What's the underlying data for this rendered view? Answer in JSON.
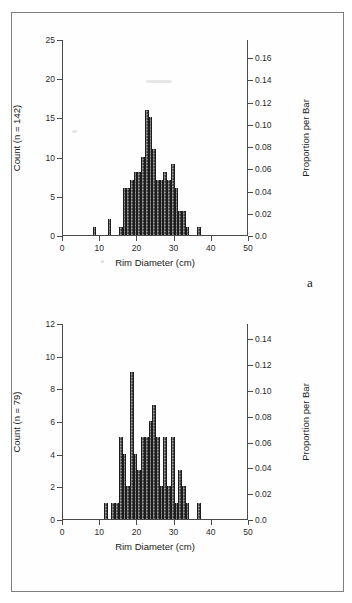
{
  "page": {
    "type": "scanned-figure-page",
    "frame_color": "#7e7e7e",
    "background": "#ffffff"
  },
  "panels": [
    {
      "letter": "a",
      "xlabel": "Rim Diameter (cm)",
      "ylabel_left": "Count (n = 142)",
      "ylabel_right": "Proportion per Bar",
      "x_ticks": [
        "0",
        "10",
        "20",
        "30",
        "40",
        "50"
      ],
      "y_ticks_left": [
        "0",
        "5",
        "10",
        "15",
        "20",
        "25"
      ],
      "y_ticks_right": [
        "0.0",
        "0.02",
        "0.04",
        "0.06",
        "0.08",
        "0.10",
        "0.12",
        "0.14",
        "0.16"
      ]
    },
    {
      "letter": "b",
      "xlabel": "Rim Diameter (cm)",
      "ylabel_left": "Count (n = 79)",
      "ylabel_right": "Proportion per Bar",
      "x_ticks": [
        "0",
        "10",
        "20",
        "30",
        "40",
        "50"
      ],
      "y_ticks_left": [
        "0",
        "2",
        "4",
        "6",
        "8",
        "10",
        "12"
      ],
      "y_ticks_right": [
        "0.0",
        "0.02",
        "0.04",
        "0.06",
        "0.08",
        "0.10",
        "0.12",
        "0.14"
      ]
    }
  ],
  "chart_data": [
    {
      "type": "bar",
      "subtype": "histogram",
      "panel": "a",
      "title": "",
      "xlabel": "Rim Diameter (cm)",
      "ylabel": "Count (n = 142)",
      "ylabel_secondary": "Proportion per Bar",
      "n": 142,
      "bin_width": 1,
      "xlim": [
        0,
        50
      ],
      "ylim": [
        0,
        25
      ],
      "ylim_secondary": [
        0.0,
        0.1761
      ],
      "grid": false,
      "legend": null,
      "bar_color": "#3b3b3b",
      "bin_left_edges": [
        8,
        9,
        12,
        13,
        15,
        16,
        17,
        18,
        19,
        20,
        21,
        22,
        23,
        24,
        25,
        26,
        27,
        28,
        29,
        30,
        31,
        32,
        33,
        36
      ],
      "values": [
        1,
        0,
        2,
        0,
        1,
        6,
        6,
        7,
        8,
        8,
        10,
        16,
        15,
        11,
        7,
        7,
        8,
        7,
        9,
        6,
        3,
        3,
        1,
        1
      ]
    },
    {
      "type": "bar",
      "subtype": "histogram",
      "panel": "b",
      "title": "",
      "xlabel": "Rim Diameter (cm)",
      "ylabel": "Count (n = 79)",
      "ylabel_secondary": "Proportion per Bar",
      "n": 79,
      "bin_width": 1,
      "xlim": [
        0,
        50
      ],
      "ylim": [
        0,
        12
      ],
      "ylim_secondary": [
        0.0,
        0.1519
      ],
      "grid": false,
      "legend": null,
      "bar_color": "#3b3b3b",
      "bin_left_edges": [
        11,
        12,
        13,
        14,
        15,
        16,
        17,
        18,
        19,
        20,
        21,
        22,
        23,
        24,
        25,
        26,
        27,
        28,
        29,
        30,
        31,
        32,
        33,
        34,
        36
      ],
      "values": [
        1,
        0,
        1,
        1,
        5,
        4,
        2,
        9,
        4,
        3,
        5,
        5,
        6,
        7,
        5,
        2,
        5,
        2,
        5,
        1,
        3,
        2,
        1,
        0,
        1
      ]
    }
  ]
}
